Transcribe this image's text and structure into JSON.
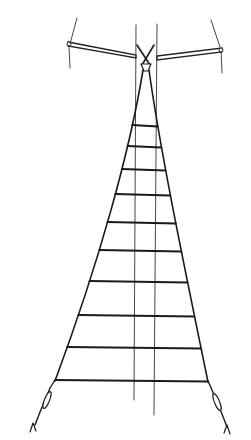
{
  "figure": {
    "rung_count": 10,
    "stroke_color": "#1a1a1a",
    "background_color": "#ffffff",
    "components": [
      "spreader-bar-left",
      "spreader-bar-right",
      "top-shackle",
      "side-ropes",
      "rungs",
      "guide-lines",
      "end-toggles"
    ]
  }
}
